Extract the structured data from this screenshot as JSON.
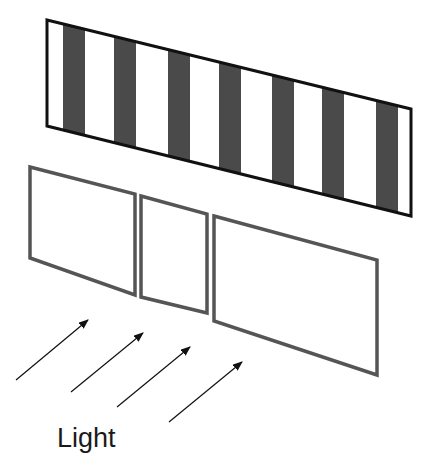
{
  "diagram": {
    "label": "Light",
    "colors": {
      "stripe_dark": "#4a4a4a",
      "band_outline": "#111111",
      "panel_outline": "#555555",
      "arrow": "#111111"
    },
    "grating": {
      "corners": [
        [
          47,
          20
        ],
        [
          411,
          109
        ],
        [
          411,
          216
        ],
        [
          47,
          126
        ]
      ],
      "stripes_x": [
        [
          63,
          85
        ],
        [
          114,
          136
        ],
        [
          168,
          190
        ],
        [
          219,
          241
        ],
        [
          272,
          294
        ],
        [
          322,
          344
        ],
        [
          376,
          398
        ]
      ]
    },
    "panels": [
      {
        "name": "panel-left",
        "points": "30,167 135,194 135,295 30,258"
      },
      {
        "name": "panel-middle",
        "points": "141,196 207,214 207,313 141,297"
      },
      {
        "name": "panel-right",
        "points": "214,216 377,260 377,375 214,321"
      }
    ],
    "arrows": [
      {
        "x1": 16,
        "y1": 380,
        "x2": 88,
        "y2": 320
      },
      {
        "x1": 71,
        "y1": 392,
        "x2": 143,
        "y2": 333
      },
      {
        "x1": 117,
        "y1": 407,
        "x2": 190,
        "y2": 347
      },
      {
        "x1": 169,
        "y1": 422,
        "x2": 242,
        "y2": 362
      }
    ]
  }
}
